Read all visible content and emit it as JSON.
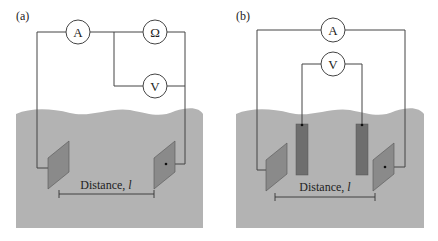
{
  "panels": [
    {
      "id": "a",
      "label": "(a)",
      "meters": {
        "ammeter": "A",
        "ohmmeter": "Ω",
        "voltmeter": "V"
      },
      "distance_label": "Distance, ",
      "distance_var": "l"
    },
    {
      "id": "b",
      "label": "(b)",
      "meters": {
        "ammeter": "A",
        "voltmeter": "V"
      },
      "distance_label": "Distance, ",
      "distance_var": "l"
    }
  ],
  "colors": {
    "ground": "#b3b3b3",
    "plate": "#8a8a8a",
    "rod": "#6e6e6e",
    "wire": "#444444"
  }
}
